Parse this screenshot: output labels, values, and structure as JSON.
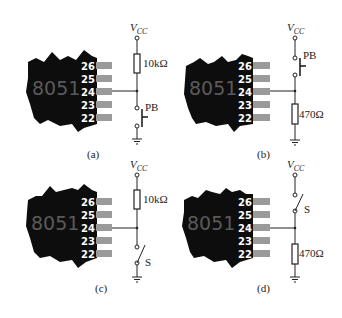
{
  "figure": {
    "panels": [
      {
        "id": "a",
        "caption": "(a)",
        "chip_label": "8051",
        "pins": [
          "26",
          "25",
          "24",
          "23",
          "22"
        ],
        "supply_label": "V",
        "supply_sub": "CC",
        "top_component": {
          "type": "resistor",
          "label": "10kΩ"
        },
        "bottom_component": {
          "type": "pushbutton",
          "label": "PB"
        },
        "connected_pin": "24"
      },
      {
        "id": "b",
        "caption": "(b)",
        "chip_label": "8051",
        "pins": [
          "26",
          "25",
          "24",
          "23",
          "22"
        ],
        "supply_label": "V",
        "supply_sub": "CC",
        "top_component": {
          "type": "pushbutton",
          "label": "PB"
        },
        "bottom_component": {
          "type": "resistor",
          "label": "470Ω"
        },
        "connected_pin": "24"
      },
      {
        "id": "c",
        "caption": "(c)",
        "chip_label": "8051",
        "pins": [
          "26",
          "25",
          "24",
          "23",
          "22"
        ],
        "supply_label": "V",
        "supply_sub": "CC",
        "top_component": {
          "type": "resistor",
          "label": "10kΩ"
        },
        "bottom_component": {
          "type": "switch",
          "label": "S"
        },
        "connected_pin": "24"
      },
      {
        "id": "d",
        "caption": "(d)",
        "chip_label": "8051",
        "pins": [
          "26",
          "25",
          "24",
          "23",
          "22"
        ],
        "supply_label": "V",
        "supply_sub": "CC",
        "top_component": {
          "type": "switch",
          "label": "S"
        },
        "bottom_component": {
          "type": "resistor",
          "label": "470Ω"
        },
        "connected_pin": "24"
      }
    ],
    "colors": {
      "chip": "#0d0d0d",
      "pin_stub": "#9a9a9a",
      "chip_text": "#5a5a5a",
      "wire": "#222222"
    }
  }
}
